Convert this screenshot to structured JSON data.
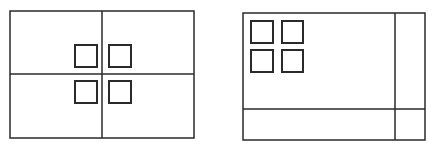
{
  "diagrams": [
    {
      "name": "centered-layout",
      "outer": {
        "x": 10,
        "y": 11,
        "w": 184,
        "h": 127
      },
      "dividers": {
        "vertical_x": 102,
        "horizontal_y": 74
      },
      "squares": [
        {
          "x": 75,
          "y": 45,
          "w": 22,
          "h": 22
        },
        {
          "x": 109,
          "y": 45,
          "w": 22,
          "h": 22
        },
        {
          "x": 75,
          "y": 81,
          "w": 22,
          "h": 22
        },
        {
          "x": 109,
          "y": 81,
          "w": 22,
          "h": 22
        }
      ]
    },
    {
      "name": "corner-layout",
      "outer": {
        "x": 243,
        "y": 13,
        "w": 182,
        "h": 127
      },
      "dividers": {
        "vertical_x": 395,
        "horizontal_y": 109
      },
      "squares": [
        {
          "x": 251,
          "y": 21,
          "w": 22,
          "h": 22
        },
        {
          "x": 282,
          "y": 21,
          "w": 21,
          "h": 22
        },
        {
          "x": 251,
          "y": 50,
          "w": 22,
          "h": 22
        },
        {
          "x": 282,
          "y": 50,
          "w": 21,
          "h": 22
        }
      ]
    }
  ],
  "colors": {
    "line": "#2a2a2a",
    "background": "#ffffff"
  }
}
